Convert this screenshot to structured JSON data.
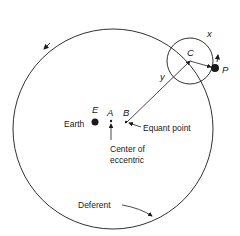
{
  "diagram": {
    "points": {
      "E": "E",
      "A": "A",
      "B": "B",
      "C": "C",
      "P": "P"
    },
    "labels": {
      "earth": "Earth",
      "equant": "Equant point",
      "center_line1": "Center of",
      "center_line2": "eccentric",
      "deferent": "Deferent",
      "x": "x",
      "y": "y"
    },
    "colors": {
      "ink": "#1a1a1a",
      "background": "#ffffff"
    }
  }
}
